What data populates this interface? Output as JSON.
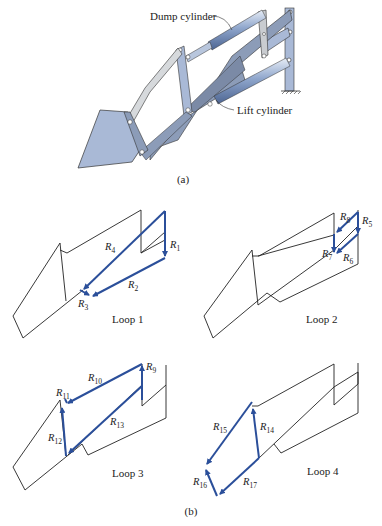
{
  "figure": {
    "part_a": {
      "caption": "(a)",
      "labels": {
        "dump_cylinder": "Dump cylinder",
        "lift_cylinder": "Lift cylinder"
      }
    },
    "part_b": {
      "caption": "(b)",
      "loops": [
        {
          "name": "Loop 1",
          "vectors": [
            "R1",
            "R2",
            "R3",
            "R4"
          ]
        },
        {
          "name": "Loop 2",
          "vectors": [
            "R5",
            "R6",
            "R7",
            "R8"
          ]
        },
        {
          "name": "Loop 3",
          "vectors": [
            "R9",
            "R10",
            "R11",
            "R12",
            "R13"
          ]
        },
        {
          "name": "Loop 4",
          "vectors": [
            "R14",
            "R15",
            "R16",
            "R17"
          ]
        }
      ]
    },
    "colors": {
      "vector": "#2b4f9a",
      "part_fill": "#a9b9d6",
      "part_dark": "#8c9cb8",
      "link_light": "#d6d9dc",
      "outline": "#222222"
    },
    "vector_labels": {
      "r1": {
        "base": "R",
        "sub": "1"
      },
      "r2": {
        "base": "R",
        "sub": "2"
      },
      "r3": {
        "base": "R",
        "sub": "3"
      },
      "r4": {
        "base": "R",
        "sub": "4"
      },
      "r5": {
        "base": "R",
        "sub": "5"
      },
      "r6": {
        "base": "R",
        "sub": "6"
      },
      "r7": {
        "base": "R",
        "sub": "7"
      },
      "r8": {
        "base": "R",
        "sub": "8"
      },
      "r9": {
        "base": "R",
        "sub": "9"
      },
      "r10": {
        "base": "R",
        "sub": "10"
      },
      "r11": {
        "base": "R",
        "sub": "11"
      },
      "r12": {
        "base": "R",
        "sub": "12"
      },
      "r13": {
        "base": "R",
        "sub": "13"
      },
      "r14": {
        "base": "R",
        "sub": "14"
      },
      "r15": {
        "base": "R",
        "sub": "15"
      },
      "r16": {
        "base": "R",
        "sub": "16"
      },
      "r17": {
        "base": "R",
        "sub": "17"
      }
    }
  }
}
